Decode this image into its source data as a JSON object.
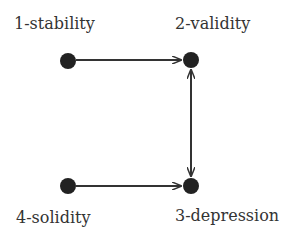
{
  "diagram": {
    "nodes": [
      {
        "id": "1",
        "label": "1-stability"
      },
      {
        "id": "2",
        "label": "2-validity"
      },
      {
        "id": "3",
        "label": "3-depression"
      },
      {
        "id": "4",
        "label": "4-solidity"
      }
    ],
    "edges": [
      {
        "from": "1",
        "to": "2",
        "type": "directed"
      },
      {
        "from": "2",
        "to": "3",
        "type": "bidirectional"
      },
      {
        "from": "4",
        "to": "3",
        "type": "directed"
      }
    ],
    "colors": {
      "node": "#222222",
      "edge": "#333333",
      "text": "#333333"
    }
  }
}
